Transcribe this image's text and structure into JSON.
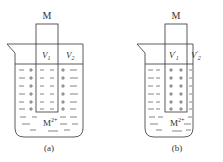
{
  "panels": [
    {
      "id": "a",
      "electrode_label": "M",
      "v_left": "V",
      "v_left_sub": "1",
      "v_left_prime": "",
      "v_right": "V",
      "v_right_sub": "2",
      "v_right_prime": "",
      "ion_label": "M",
      "ion_charge": "2+",
      "caption": "(a)",
      "electrode_charge": "-",
      "solution_charge": "+"
    },
    {
      "id": "b",
      "electrode_label": "M",
      "v_left": "V",
      "v_left_sub": "1",
      "v_left_prime": "′",
      "v_right": "V",
      "v_right_sub": "2",
      "v_right_prime": "′",
      "ion_label": "M",
      "ion_charge": "2+",
      "caption": "(b)",
      "electrode_charge": "+",
      "solution_charge": "-"
    }
  ],
  "colors": {
    "stroke": "#333333",
    "text": "#333333"
  }
}
